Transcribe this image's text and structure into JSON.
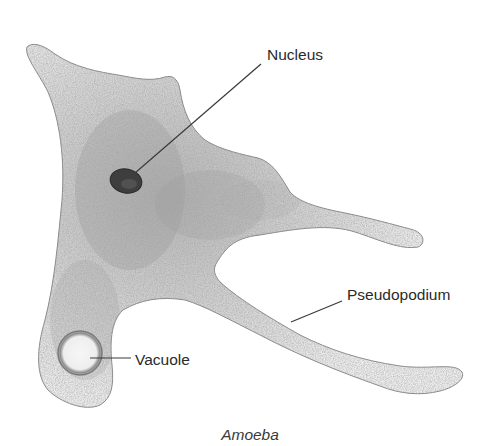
{
  "figure": {
    "title": "Amoeba",
    "caption": "Amoeba",
    "labels": {
      "nucleus": "Nucleus",
      "pseudopodium": "Pseudopodium",
      "vacuole": "Vacuole"
    },
    "colors": {
      "background": "#ffffff",
      "cytoplasm_light": "#e8e8e8",
      "cytoplasm_dark": "#9a9a9a",
      "outline": "#8a8a8a",
      "nucleus": "#3c3c3c",
      "text": "#2a2a2a"
    }
  }
}
